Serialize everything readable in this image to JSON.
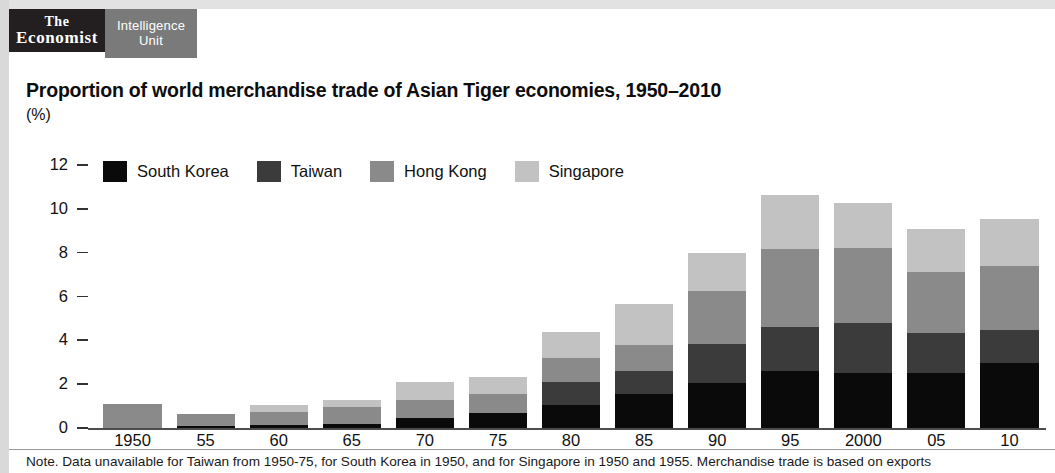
{
  "brand": {
    "economist_line1": "The",
    "economist_line2": "Economist",
    "eiu_line1": "Intelligence",
    "eiu_line2": "Unit"
  },
  "header": {
    "title": "Proportion of world merchandise trade of Asian Tiger economies, 1950–2010",
    "subtitle": "(%)"
  },
  "footnote": "Note. Data unavailable for Taiwan from 1950-75, for South Korea in 1950, and for Singapore in 1950 and 1955. Merchandise trade is based on exports",
  "colors": {
    "south_korea": "#0a0a0a",
    "taiwan": "#3b3b3b",
    "hong_kong": "#8a8a8a",
    "singapore": "#c2c2c2",
    "axis": "#4d4d4d",
    "text": "#111111",
    "brand_dark": "#231f20",
    "brand_gray": "#7a7a7a"
  },
  "chart_data": {
    "type": "bar",
    "stacked": true,
    "title": "Proportion of world merchandise trade of Asian Tiger economies, 1950–2010",
    "xlabel": "",
    "ylabel": "(%)",
    "ylim": [
      0,
      12
    ],
    "yticks": [
      0,
      2,
      4,
      6,
      8,
      10,
      12
    ],
    "grid": false,
    "legend_position": "top-left",
    "categories": [
      "1950",
      "55",
      "60",
      "65",
      "70",
      "75",
      "80",
      "85",
      "90",
      "95",
      "2000",
      "05",
      "10"
    ],
    "series": [
      {
        "name": "South Korea",
        "color": "#0a0a0a",
        "values": [
          0.0,
          0.1,
          0.12,
          0.2,
          0.45,
          0.7,
          1.05,
          1.55,
          2.05,
          2.6,
          2.5,
          2.5,
          2.95
        ]
      },
      {
        "name": "Taiwan",
        "color": "#3b3b3b",
        "values": [
          0.0,
          0.0,
          0.0,
          0.0,
          0.0,
          0.0,
          1.05,
          1.05,
          1.8,
          2.0,
          2.3,
          1.85,
          1.5
        ]
      },
      {
        "name": "Hong Kong",
        "color": "#8a8a8a",
        "values": [
          1.1,
          0.55,
          0.62,
          0.75,
          0.85,
          0.85,
          1.1,
          1.2,
          2.4,
          3.55,
          3.4,
          2.75,
          2.95
        ]
      },
      {
        "name": "Singapore",
        "color": "#c2c2c2",
        "values": [
          0.0,
          0.0,
          0.3,
          0.35,
          0.8,
          0.8,
          1.2,
          1.85,
          1.75,
          2.5,
          2.05,
          2.0,
          2.15
        ]
      }
    ],
    "totals": [
      1.1,
      0.75,
      1.05,
      1.3,
      2.1,
      2.35,
      4.4,
      5.65,
      8.0,
      10.65,
      10.25,
      9.1,
      9.55
    ]
  }
}
